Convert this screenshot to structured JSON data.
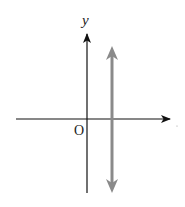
{
  "diagram": {
    "type": "coordinate-plane",
    "axes": {
      "x_axis": {
        "label": ""
      },
      "y_axis": {
        "label": "y"
      },
      "origin_label": "O"
    },
    "line": {
      "kind": "vertical",
      "description": "vertical line with arrows at both ends, to the right of the y-axis",
      "color": "#8a8a8a"
    },
    "colors": {
      "axes": "#111111",
      "line": "#8a8a8a"
    }
  }
}
